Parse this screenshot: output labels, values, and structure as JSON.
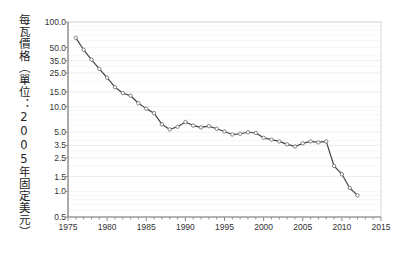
{
  "chart_data": {
    "type": "line",
    "title": "",
    "xlabel": "",
    "ylabel": "每瓦價格（單位：2005年固定美元）",
    "yscale": "log",
    "xscale": "linear",
    "xlim": [
      1975,
      2015
    ],
    "ylim": [
      0.5,
      100.0
    ],
    "grid": true,
    "legend": null,
    "marker": "open-circle",
    "line_color": "#444444",
    "marker_color": "#777777",
    "gridline_color": "#f0f0f0",
    "axis_color": "#888888",
    "ytick_labels": [
      "100.0",
      "50.0",
      "35.0",
      "25.0",
      "15.0",
      "10.0",
      "5.0",
      "3.5",
      "2.5",
      "1.5",
      "1.0",
      "0.5"
    ],
    "ytick_values": [
      100.0,
      50.0,
      35.0,
      25.0,
      15.0,
      10.0,
      5.0,
      3.5,
      2.5,
      1.5,
      1.0,
      0.5
    ],
    "xtick_labels": [
      "1975",
      "1980",
      "1985",
      "1990",
      "1995",
      "2000",
      "2005",
      "2010",
      "2015"
    ],
    "xtick_values": [
      1975,
      1980,
      1985,
      1990,
      1995,
      2000,
      2005,
      2010,
      2015
    ],
    "xminor_step": 1,
    "series": [
      {
        "name": "每瓦價格",
        "x": [
          1976,
          1977,
          1978,
          1979,
          1980,
          1981,
          1982,
          1983,
          1984,
          1985,
          1986,
          1987,
          1988,
          1989,
          1990,
          1991,
          1992,
          1993,
          1994,
          1995,
          1996,
          1997,
          1998,
          1999,
          2000,
          2001,
          2002,
          2003,
          2004,
          2005,
          2006,
          2007,
          2008,
          2009,
          2010,
          2011,
          2012
        ],
        "values": [
          65.0,
          47.0,
          36.0,
          28.0,
          22.0,
          17.0,
          14.5,
          13.5,
          11.0,
          9.5,
          8.4,
          6.2,
          5.4,
          5.8,
          6.6,
          6.0,
          5.7,
          5.9,
          5.5,
          5.1,
          4.7,
          4.8,
          5.0,
          4.9,
          4.3,
          4.1,
          3.9,
          3.6,
          3.4,
          3.7,
          3.9,
          3.8,
          3.9,
          2.0,
          1.6,
          1.1,
          0.9
        ]
      }
    ]
  },
  "axes": {
    "y_axis_title": "每瓦價格（單位：2005年固定美元）"
  }
}
